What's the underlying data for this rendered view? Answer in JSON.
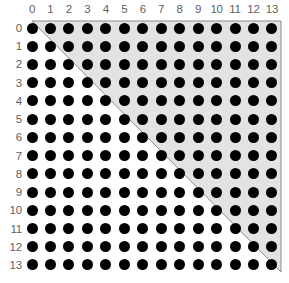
{
  "figure": {
    "title": "",
    "background_color": "#ffffff",
    "width": 289,
    "height": 283
  },
  "chart_data": {
    "type": "scatter",
    "title": "",
    "subtitle": "",
    "xlabel": "",
    "ylabel": "",
    "grid": false,
    "legend": null,
    "n_rows": 14,
    "n_cols": 14,
    "x": [
      0,
      1,
      2,
      3,
      4,
      5,
      6,
      7,
      8,
      9,
      10,
      11,
      12,
      13
    ],
    "y": [
      0,
      1,
      2,
      3,
      4,
      5,
      6,
      7,
      8,
      9,
      10,
      11,
      12,
      13
    ],
    "col_labels": [
      "0",
      "1",
      "2",
      "3",
      "4",
      "5",
      "6",
      "7",
      "8",
      "9",
      "10",
      "11",
      "12",
      "13"
    ],
    "row_labels": [
      "0",
      "1",
      "2",
      "3",
      "4",
      "5",
      "6",
      "7",
      "8",
      "9",
      "10",
      "11",
      "12",
      "13"
    ],
    "marker": {
      "shape": "circle",
      "filled": true,
      "color": "#000000",
      "diameter_px": 11
    },
    "point_count": 196,
    "geometry": {
      "origin_x_px": 32,
      "origin_y_px": 28,
      "spacing_x_px": 18.46,
      "spacing_y_px": 18.23
    },
    "shaded_region": {
      "label": "",
      "shape": "triangle",
      "fill_color": "#e3e3e3",
      "border_color": "#8a8a8a",
      "covers": "upper-right half including the main diagonal",
      "vertices_cells": [
        [
          0,
          0
        ],
        [
          13,
          0
        ],
        [
          13,
          13
        ]
      ],
      "vertices_px": [
        [
          32,
          21
        ],
        [
          281,
          21
        ],
        [
          281,
          272
        ]
      ]
    }
  },
  "axes": {
    "top_axis_name": "column-index",
    "left_axis_name": "row-index"
  }
}
